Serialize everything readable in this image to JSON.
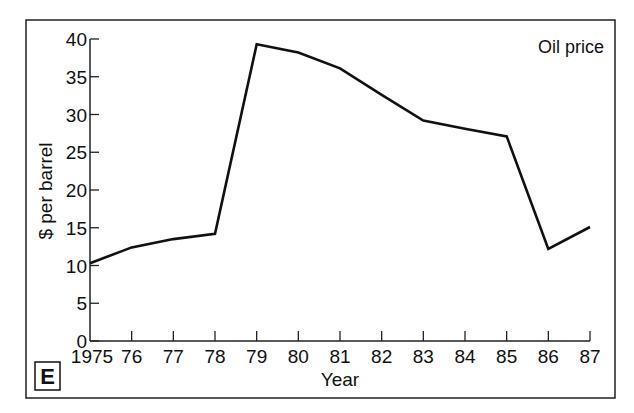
{
  "chart_data": {
    "type": "line",
    "title": "",
    "annotation": "Oil price",
    "panel_label": "E",
    "xlabel": "Year",
    "ylabel": "$ per barrel",
    "x": [
      "1975",
      "76",
      "77",
      "78",
      "79",
      "80",
      "81",
      "82",
      "83",
      "84",
      "85",
      "86",
      "87"
    ],
    "categories": [
      "1975",
      "76",
      "77",
      "78",
      "79",
      "80",
      "81",
      "82",
      "83",
      "84",
      "85",
      "86",
      "87"
    ],
    "series": [
      {
        "name": "Oil price",
        "values": [
          10.3,
          12.4,
          13.5,
          14.2,
          39.3,
          38.2,
          36.1,
          32.6,
          29.2,
          28.1,
          27.1,
          12.2,
          15.1
        ]
      }
    ],
    "yticks": [
      "0",
      "5",
      "10",
      "15",
      "20",
      "25",
      "30",
      "35",
      "40"
    ],
    "ylim": [
      0,
      40
    ],
    "grid": false,
    "legend_position": "top-right"
  }
}
